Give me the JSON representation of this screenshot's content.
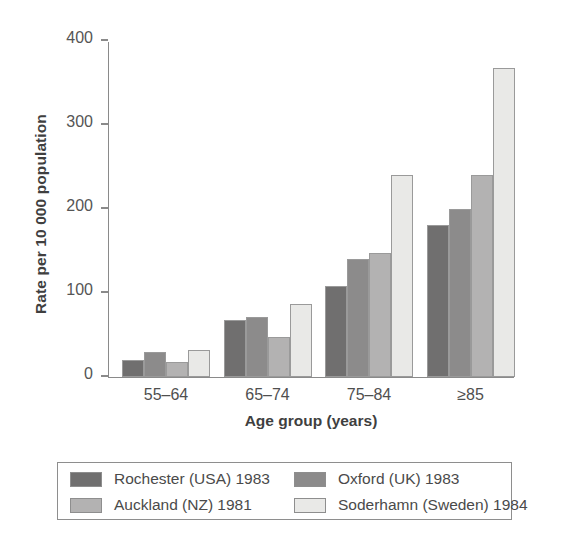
{
  "chart_data": {
    "type": "bar",
    "title": "",
    "subtitle": "",
    "xlabel": "Age group (years)",
    "ylabel": "Rate per 10 000 population",
    "categories": [
      "55–64",
      "65–74",
      "75–84",
      "≥85"
    ],
    "ylim": [
      0,
      400
    ],
    "yticks": [
      0,
      100,
      200,
      300,
      400
    ],
    "ytick_labels": [
      "0",
      "100",
      "200",
      "300",
      "400"
    ],
    "grid": false,
    "legend_position": "bottom",
    "series": [
      {
        "name": "Rochester (USA) 1983",
        "color": "#706f6f",
        "values": [
          20,
          67,
          108,
          180
        ]
      },
      {
        "name": "Oxford (UK) 1983",
        "color": "#8c8b8b",
        "values": [
          29,
          71,
          140,
          200
        ]
      },
      {
        "name": "Auckland (NZ) 1981",
        "color": "#b3b2b2",
        "values": [
          18,
          47,
          147,
          240
        ]
      },
      {
        "name": "Soderhamn (Sweden) 1984",
        "color": "#e9e9e7",
        "values": [
          32,
          86,
          240,
          368
        ]
      }
    ]
  },
  "legend": {
    "entries": [
      {
        "label": "Rochester (USA) 1983",
        "color": "#706f6f"
      },
      {
        "label": "Oxford (UK) 1983",
        "color": "#8c8b8b"
      },
      {
        "label": "Auckland (NZ) 1981",
        "color": "#b3b2b2"
      },
      {
        "label": "Soderhamn (Sweden) 1984",
        "color": "#e9e9e7"
      }
    ]
  }
}
